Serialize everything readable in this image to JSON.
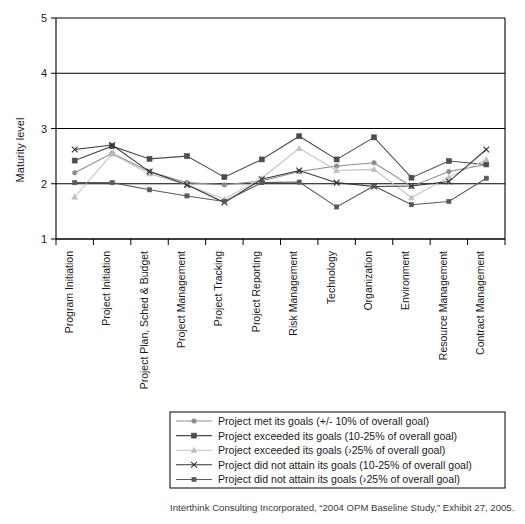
{
  "chart_data": {
    "type": "line",
    "title": "",
    "xlabel": "",
    "ylabel": "Maturity level",
    "ylim": [
      1,
      5
    ],
    "yticks": [
      1,
      2,
      3,
      4,
      5
    ],
    "grid": "horizontal",
    "legend_position": "below-plot",
    "categories": [
      "Program Initiation",
      "Project Initiation",
      "Project Plan, Sched & Budget",
      "Project Management",
      "Project Tracking",
      "Project Reporting",
      "Risk Management",
      "Technology",
      "Organization",
      "Environment",
      "Resource Management",
      "Contract Management"
    ],
    "series": [
      {
        "name": "Project met its goals (+/- 10% of overall goal)",
        "marker": "circle",
        "color": "#8c8c8c",
        "values": [
          2.2,
          2.55,
          2.22,
          2.02,
          1.98,
          2.05,
          2.22,
          2.32,
          2.38,
          1.95,
          2.22,
          2.35
        ]
      },
      {
        "name": "Project exceeded its goals (10-25% of overall goal)",
        "marker": "square",
        "color": "#4d4d4d",
        "values": [
          2.42,
          2.68,
          2.45,
          2.5,
          2.12,
          2.44,
          2.86,
          2.44,
          2.84,
          2.11,
          2.41,
          2.35
        ]
      },
      {
        "name": "Project exceeded its goals (>25% of overall goal)",
        "marker": "triangle",
        "color": "#bfbfbf",
        "values": [
          1.76,
          2.54,
          2.18,
          1.98,
          1.72,
          2.1,
          2.64,
          2.24,
          2.26,
          1.75,
          2.12,
          2.44
        ]
      },
      {
        "name": "Project did not attain its goals (10-25% of overall goal)",
        "marker": "x",
        "color": "#333333",
        "values": [
          2.62,
          2.7,
          2.22,
          1.98,
          1.66,
          2.08,
          2.24,
          2.02,
          1.95,
          1.96,
          2.04,
          2.62
        ]
      },
      {
        "name": "Project did not attain its goals (>25% of overall goal)",
        "marker": "square-small",
        "color": "#5a5a5a",
        "values": [
          2.02,
          2.02,
          1.89,
          1.78,
          1.68,
          2.02,
          2.03,
          1.58,
          1.96,
          1.62,
          1.68,
          2.1
        ]
      }
    ]
  },
  "axis": {
    "y_title": "Maturity level",
    "y_tick_labels": [
      "5",
      "4",
      "3",
      "2",
      "1"
    ]
  },
  "legend": {
    "items": [
      {
        "label": "Project met its goals (+/- 10% of overall goal)",
        "marker": "circle"
      },
      {
        "label": "Project exceeded its goals (10-25% of overall goal)",
        "marker": "square"
      },
      {
        "label": "Project exceeded its goals (›25% of overall goal)",
        "marker": "triangle"
      },
      {
        "label": "Project did not attain its goals (10-25% of overall goal)",
        "marker": "x"
      },
      {
        "label": "Project did not attain its goals (›25% of overall goal)",
        "marker": "square-small"
      }
    ]
  },
  "caption": {
    "text": "Interthink Consulting Incorporated, “2004 OPM Baseline Study,” Exhibit 27, 2005."
  }
}
